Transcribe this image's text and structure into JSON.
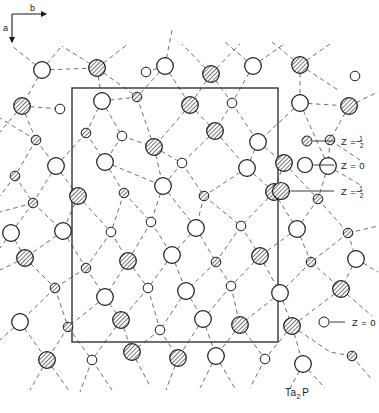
{
  "figure": {
    "caption": "Ta2P",
    "caption_parts": {
      "element_a": "Ta",
      "subscript": "2",
      "element_b": "P"
    },
    "axes": {
      "horizontal_label": "b",
      "vertical_label": "a"
    },
    "colors": {
      "line": "#1a1a1a",
      "bond_dash": "#555555",
      "hatch": "#444444",
      "background": "#ffffff",
      "cell_border": "#333333"
    },
    "unit_cell": {
      "x": 72,
      "y": 88,
      "width": 206,
      "height": 254
    }
  },
  "legend": {
    "right_items": [
      {
        "symbol": "small-hatched-circle",
        "label": "Z =",
        "value": "1/2",
        "numerator": "1",
        "denominator": "2",
        "r": 5.0,
        "sx": 307,
        "sy": 141,
        "lx": 334,
        "tx": 341
      },
      {
        "symbol": "medium-open-circle",
        "label": "Z =",
        "value": "0",
        "numerator": "",
        "denominator": "",
        "r": 7.5,
        "sx": 305,
        "sy": 165,
        "lx": 334,
        "tx": 341
      },
      {
        "symbol": "large-hatched-circle",
        "label": "Z =",
        "value": "1/2",
        "numerator": "1",
        "denominator": "2",
        "r": 8.5,
        "sx": 281,
        "sy": 191,
        "lx": 334,
        "tx": 341
      }
    ],
    "bottom_items": [
      {
        "symbol": "small-open-circle",
        "label": "Z =",
        "value": "0",
        "numerator": "",
        "denominator": "",
        "r": 5.0,
        "sx": 324,
        "sy": 322,
        "lx": 345,
        "tx": 352
      }
    ]
  },
  "chart_data": {
    "type": "scatter",
    "title": "Ta2P",
    "xlabel": "b",
    "ylabel": "a",
    "grid": false,
    "legend_position": "right",
    "site_types": [
      {
        "name": "Ta z=0",
        "symbol": "large-open-circle",
        "radius": 8.5,
        "fill": "open",
        "z": 0
      },
      {
        "name": "Ta z=1/2",
        "symbol": "large-hatched-circle",
        "radius": 8.5,
        "fill": "hatched",
        "z": 0.5
      },
      {
        "name": "P z=0",
        "symbol": "small-open-circle",
        "radius": 5.0,
        "fill": "open",
        "z": 0
      },
      {
        "name": "P z=1/2",
        "symbol": "small-hatched-circle",
        "radius": 5.0,
        "fill": "hatched",
        "z": 0.5
      }
    ],
    "atoms": [
      {
        "x": 42,
        "y": 70,
        "t": "Ta0"
      },
      {
        "x": 97,
        "y": 68,
        "t": "Ta5"
      },
      {
        "x": 165,
        "y": 66,
        "t": "Ta0"
      },
      {
        "x": 211,
        "y": 74,
        "t": "Ta5"
      },
      {
        "x": 253,
        "y": 66,
        "t": "Ta0"
      },
      {
        "x": 300,
        "y": 65,
        "t": "Ta5"
      },
      {
        "x": 146,
        "y": 72,
        "t": "P0"
      },
      {
        "x": 355,
        "y": 76,
        "t": "P0"
      },
      {
        "x": 22,
        "y": 106,
        "t": "Ta5"
      },
      {
        "x": 60,
        "y": 109,
        "t": "P0"
      },
      {
        "x": 102,
        "y": 101,
        "t": "Ta0"
      },
      {
        "x": 137,
        "y": 97,
        "t": "P5"
      },
      {
        "x": 190,
        "y": 105,
        "t": "Ta5"
      },
      {
        "x": 232,
        "y": 103,
        "t": "P0"
      },
      {
        "x": 300,
        "y": 103,
        "t": "Ta0"
      },
      {
        "x": 349,
        "y": 106,
        "t": "Ta5"
      },
      {
        "x": 36,
        "y": 140,
        "t": "P5"
      },
      {
        "x": 86,
        "y": 133,
        "t": "P5"
      },
      {
        "x": 122,
        "y": 136,
        "t": "P0"
      },
      {
        "x": 154,
        "y": 147,
        "t": "Ta5"
      },
      {
        "x": 215,
        "y": 131,
        "t": "Ta5"
      },
      {
        "x": 258,
        "y": 142,
        "t": "Ta0"
      },
      {
        "x": 330,
        "y": 140,
        "t": "P5"
      },
      {
        "x": 15,
        "y": 176,
        "t": "P5"
      },
      {
        "x": 56,
        "y": 166,
        "t": "Ta0"
      },
      {
        "x": 105,
        "y": 162,
        "t": "Ta0"
      },
      {
        "x": 182,
        "y": 163,
        "t": "P0"
      },
      {
        "x": 247,
        "y": 168,
        "t": "Ta0"
      },
      {
        "x": 284,
        "y": 163,
        "t": "Ta5"
      },
      {
        "x": 328,
        "y": 166,
        "t": "Ta0"
      },
      {
        "x": 33,
        "y": 203,
        "t": "P5"
      },
      {
        "x": 78,
        "y": 196,
        "t": "Ta5"
      },
      {
        "x": 124,
        "y": 193,
        "t": "P5"
      },
      {
        "x": 163,
        "y": 186,
        "t": "Ta0"
      },
      {
        "x": 204,
        "y": 196,
        "t": "P5"
      },
      {
        "x": 274,
        "y": 192,
        "t": "Ta5"
      },
      {
        "x": 318,
        "y": 199,
        "t": "P5"
      },
      {
        "x": 11,
        "y": 233,
        "t": "Ta0"
      },
      {
        "x": 63,
        "y": 231,
        "t": "Ta0"
      },
      {
        "x": 111,
        "y": 232,
        "t": "P0"
      },
      {
        "x": 151,
        "y": 222,
        "t": "P0"
      },
      {
        "x": 196,
        "y": 228,
        "t": "Ta0"
      },
      {
        "x": 241,
        "y": 226,
        "t": "P0"
      },
      {
        "x": 297,
        "y": 229,
        "t": "Ta0"
      },
      {
        "x": 348,
        "y": 233,
        "t": "P5"
      },
      {
        "x": 25,
        "y": 258,
        "t": "Ta5"
      },
      {
        "x": 86,
        "y": 268,
        "t": "P5"
      },
      {
        "x": 128,
        "y": 261,
        "t": "Ta5"
      },
      {
        "x": 172,
        "y": 255,
        "t": "Ta0"
      },
      {
        "x": 216,
        "y": 262,
        "t": "P5"
      },
      {
        "x": 260,
        "y": 256,
        "t": "Ta5"
      },
      {
        "x": 311,
        "y": 262,
        "t": "P5"
      },
      {
        "x": 356,
        "y": 259,
        "t": "Ta0"
      },
      {
        "x": 55,
        "y": 288,
        "t": "P5"
      },
      {
        "x": 105,
        "y": 297,
        "t": "Ta0"
      },
      {
        "x": 148,
        "y": 288,
        "t": "P0"
      },
      {
        "x": 186,
        "y": 291,
        "t": "Ta0"
      },
      {
        "x": 231,
        "y": 286,
        "t": "P0"
      },
      {
        "x": 280,
        "y": 293,
        "t": "Ta0"
      },
      {
        "x": 341,
        "y": 289,
        "t": "Ta5"
      },
      {
        "x": 20,
        "y": 322,
        "t": "Ta0"
      },
      {
        "x": 68,
        "y": 327,
        "t": "P5"
      },
      {
        "x": 121,
        "y": 320,
        "t": "Ta5"
      },
      {
        "x": 160,
        "y": 330,
        "t": "P0"
      },
      {
        "x": 203,
        "y": 319,
        "t": "Ta0"
      },
      {
        "x": 240,
        "y": 325,
        "t": "Ta5"
      },
      {
        "x": 292,
        "y": 326,
        "t": "Ta5"
      },
      {
        "x": 47,
        "y": 360,
        "t": "Ta5"
      },
      {
        "x": 92,
        "y": 360,
        "t": "P0"
      },
      {
        "x": 132,
        "y": 352,
        "t": "Ta5"
      },
      {
        "x": 178,
        "y": 358,
        "t": "Ta5"
      },
      {
        "x": 216,
        "y": 356,
        "t": "Ta0"
      },
      {
        "x": 265,
        "y": 359,
        "t": "P0"
      },
      {
        "x": 303,
        "y": 364,
        "t": "Ta0"
      },
      {
        "x": 352,
        "y": 356,
        "t": "P5"
      }
    ],
    "bonds": [
      [
        42,
        70,
        22,
        106
      ],
      [
        42,
        70,
        60,
        48
      ],
      [
        42,
        70,
        97,
        68
      ],
      [
        42,
        70,
        12,
        46
      ],
      [
        97,
        68,
        137,
        97
      ],
      [
        97,
        68,
        102,
        101
      ],
      [
        97,
        68,
        128,
        44
      ],
      [
        97,
        68,
        62,
        46
      ],
      [
        165,
        66,
        146,
        72
      ],
      [
        165,
        66,
        190,
        105
      ],
      [
        165,
        66,
        172,
        30
      ],
      [
        165,
        66,
        137,
        97
      ],
      [
        211,
        74,
        232,
        103
      ],
      [
        211,
        74,
        190,
        105
      ],
      [
        211,
        74,
        240,
        44
      ],
      [
        211,
        74,
        182,
        44
      ],
      [
        253,
        66,
        232,
        103
      ],
      [
        253,
        66,
        284,
        44
      ],
      [
        253,
        66,
        225,
        42
      ],
      [
        300,
        65,
        330,
        44
      ],
      [
        300,
        65,
        272,
        42
      ],
      [
        300,
        65,
        300,
        103
      ],
      [
        300,
        65,
        338,
        90
      ],
      [
        22,
        106,
        36,
        140
      ],
      [
        22,
        106,
        60,
        109
      ],
      [
        22,
        106,
        0,
        132
      ],
      [
        102,
        101,
        122,
        136
      ],
      [
        102,
        101,
        86,
        133
      ],
      [
        102,
        101,
        137,
        97
      ],
      [
        137,
        97,
        154,
        147
      ],
      [
        190,
        105,
        215,
        131
      ],
      [
        190,
        105,
        154,
        147
      ],
      [
        232,
        103,
        215,
        131
      ],
      [
        232,
        103,
        258,
        142
      ],
      [
        300,
        103,
        328,
        166
      ],
      [
        300,
        103,
        258,
        142
      ],
      [
        300,
        103,
        349,
        106
      ],
      [
        349,
        106,
        330,
        140
      ],
      [
        349,
        106,
        378,
        92
      ],
      [
        36,
        140,
        56,
        166
      ],
      [
        36,
        140,
        15,
        176
      ],
      [
        86,
        133,
        105,
        162
      ],
      [
        86,
        133,
        56,
        166
      ],
      [
        122,
        136,
        105,
        162
      ],
      [
        122,
        136,
        154,
        147
      ],
      [
        154,
        147,
        163,
        186
      ],
      [
        154,
        147,
        182,
        163
      ],
      [
        215,
        131,
        247,
        168
      ],
      [
        215,
        131,
        182,
        163
      ],
      [
        258,
        142,
        284,
        163
      ],
      [
        258,
        142,
        247,
        168
      ],
      [
        330,
        140,
        328,
        166
      ],
      [
        330,
        140,
        360,
        160
      ],
      [
        15,
        176,
        33,
        203
      ],
      [
        56,
        166,
        78,
        196
      ],
      [
        56,
        166,
        33,
        203
      ],
      [
        105,
        162,
        124,
        193
      ],
      [
        105,
        162,
        163,
        186
      ],
      [
        182,
        163,
        163,
        186
      ],
      [
        182,
        163,
        204,
        196
      ],
      [
        247,
        168,
        274,
        192
      ],
      [
        247,
        168,
        204,
        196
      ],
      [
        284,
        163,
        318,
        199
      ],
      [
        284,
        163,
        274,
        192
      ],
      [
        328,
        166,
        318,
        199
      ],
      [
        328,
        166,
        362,
        186
      ],
      [
        33,
        203,
        11,
        233
      ],
      [
        33,
        203,
        63,
        231
      ],
      [
        78,
        196,
        111,
        232
      ],
      [
        78,
        196,
        63,
        231
      ],
      [
        124,
        193,
        151,
        222
      ],
      [
        124,
        193,
        111,
        232
      ],
      [
        163,
        186,
        196,
        228
      ],
      [
        163,
        186,
        151,
        222
      ],
      [
        204,
        196,
        196,
        228
      ],
      [
        204,
        196,
        241,
        226
      ],
      [
        274,
        192,
        297,
        229
      ],
      [
        274,
        192,
        241,
        226
      ],
      [
        318,
        199,
        348,
        233
      ],
      [
        318,
        199,
        297,
        229
      ],
      [
        11,
        233,
        25,
        258
      ],
      [
        63,
        231,
        86,
        268
      ],
      [
        63,
        231,
        25,
        258
      ],
      [
        111,
        232,
        128,
        261
      ],
      [
        111,
        232,
        86,
        268
      ],
      [
        151,
        222,
        172,
        255
      ],
      [
        151,
        222,
        128,
        261
      ],
      [
        196,
        228,
        216,
        262
      ],
      [
        196,
        228,
        172,
        255
      ],
      [
        241,
        226,
        260,
        256
      ],
      [
        241,
        226,
        216,
        262
      ],
      [
        297,
        229,
        311,
        262
      ],
      [
        297,
        229,
        260,
        256
      ],
      [
        348,
        233,
        356,
        259
      ],
      [
        348,
        233,
        311,
        262
      ],
      [
        25,
        258,
        55,
        288
      ],
      [
        86,
        268,
        105,
        297
      ],
      [
        86,
        268,
        55,
        288
      ],
      [
        128,
        261,
        148,
        288
      ],
      [
        128,
        261,
        105,
        297
      ],
      [
        172,
        255,
        186,
        291
      ],
      [
        172,
        255,
        148,
        288
      ],
      [
        216,
        262,
        231,
        286
      ],
      [
        216,
        262,
        186,
        291
      ],
      [
        260,
        256,
        280,
        293
      ],
      [
        260,
        256,
        231,
        286
      ],
      [
        311,
        262,
        341,
        289
      ],
      [
        311,
        262,
        280,
        293
      ],
      [
        356,
        259,
        341,
        289
      ],
      [
        55,
        288,
        20,
        322
      ],
      [
        55,
        288,
        68,
        327
      ],
      [
        105,
        297,
        121,
        320
      ],
      [
        105,
        297,
        68,
        327
      ],
      [
        148,
        288,
        160,
        330
      ],
      [
        148,
        288,
        121,
        320
      ],
      [
        186,
        291,
        203,
        319
      ],
      [
        186,
        291,
        160,
        330
      ],
      [
        231,
        286,
        240,
        325
      ],
      [
        231,
        286,
        203,
        319
      ],
      [
        280,
        293,
        292,
        326
      ],
      [
        280,
        293,
        240,
        325
      ],
      [
        341,
        289,
        292,
        326
      ],
      [
        341,
        289,
        372,
        316
      ],
      [
        20,
        322,
        47,
        360
      ],
      [
        68,
        327,
        92,
        360
      ],
      [
        68,
        327,
        47,
        360
      ],
      [
        121,
        320,
        132,
        352
      ],
      [
        121,
        320,
        92,
        360
      ],
      [
        160,
        330,
        178,
        358
      ],
      [
        160,
        330,
        132,
        352
      ],
      [
        203,
        319,
        216,
        356
      ],
      [
        203,
        319,
        178,
        358
      ],
      [
        240,
        325,
        265,
        359
      ],
      [
        240,
        325,
        216,
        356
      ],
      [
        292,
        326,
        303,
        364
      ],
      [
        292,
        326,
        265,
        359
      ],
      [
        292,
        326,
        330,
        352
      ],
      [
        47,
        360,
        30,
        390
      ],
      [
        47,
        360,
        70,
        392
      ],
      [
        92,
        360,
        80,
        392
      ],
      [
        92,
        360,
        112,
        390
      ],
      [
        132,
        352,
        150,
        386
      ],
      [
        178,
        358,
        166,
        390
      ],
      [
        216,
        356,
        200,
        388
      ],
      [
        216,
        356,
        236,
        390
      ],
      [
        265,
        359,
        250,
        388
      ],
      [
        303,
        364,
        288,
        392
      ],
      [
        303,
        364,
        325,
        388
      ],
      [
        352,
        356,
        372,
        380
      ],
      [
        352,
        356,
        330,
        352
      ],
      [
        15,
        176,
        0,
        196
      ],
      [
        11,
        233,
        0,
        248
      ],
      [
        25,
        258,
        0,
        270
      ],
      [
        20,
        322,
        0,
        340
      ],
      [
        36,
        140,
        0,
        118
      ],
      [
        33,
        203,
        0,
        212
      ],
      [
        356,
        259,
        378,
        272
      ],
      [
        348,
        233,
        378,
        226
      ]
    ]
  }
}
